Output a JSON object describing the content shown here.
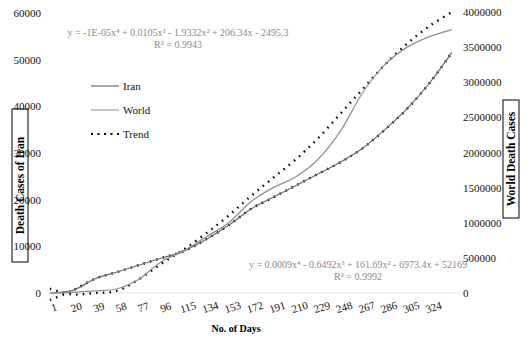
{
  "chart_data": {
    "type": "line",
    "title": "",
    "xlabel": "No. of Days",
    "ylabel": "Death Cases of Iran",
    "y2label": "World Death Cases",
    "x_ticks": [
      "1",
      "20",
      "39",
      "58",
      "77",
      "96",
      "115",
      "134",
      "153",
      "172",
      "191",
      "210",
      "229",
      "248",
      "267",
      "286",
      "305",
      "324"
    ],
    "y_ticks": [
      "0",
      "10000",
      "20000",
      "30000",
      "40000",
      "50000",
      "60000"
    ],
    "y2_ticks": [
      "0",
      "500000",
      "1000000",
      "1500000",
      "2000000",
      "2500000",
      "3000000",
      "3500000",
      "4000000"
    ],
    "ylim": [
      0,
      60000
    ],
    "y2lim": [
      0,
      4000000
    ],
    "xlim": [
      1,
      343
    ],
    "grid": false,
    "legend": {
      "position": "upper-left",
      "entries": [
        {
          "label": "Iran",
          "style": "solid",
          "color": "#666666"
        },
        {
          "label": "World",
          "style": "solid",
          "color": "#9a9a9a"
        },
        {
          "label": "Trend",
          "style": "dotted",
          "color": "#000000"
        }
      ]
    },
    "series": [
      {
        "name": "Iran",
        "axis": "left",
        "x": [
          1,
          20,
          39,
          58,
          77,
          96,
          115,
          134,
          153,
          172,
          191,
          210,
          229,
          248,
          267,
          286,
          305,
          324,
          343
        ],
        "values": [
          0,
          500,
          3000,
          4500,
          6000,
          7500,
          9000,
          11500,
          14500,
          18000,
          20500,
          23000,
          25500,
          28000,
          31000,
          35000,
          39500,
          45000,
          51500
        ]
      },
      {
        "name": "World",
        "axis": "right",
        "x": [
          1,
          20,
          39,
          58,
          77,
          96,
          115,
          134,
          153,
          172,
          191,
          210,
          229,
          248,
          267,
          286,
          305,
          324,
          343
        ],
        "values": [
          0,
          10000,
          30000,
          60000,
          200000,
          450000,
          600000,
          800000,
          1000000,
          1300000,
          1500000,
          1650000,
          1900000,
          2300000,
          2850000,
          3250000,
          3500000,
          3650000,
          3750000
        ]
      },
      {
        "name": "Trend (Iran poly fit)",
        "axis": "left",
        "equation": "y = 0.0009x⁴ - 0.6492x³ + 161.69x² - 6973.4x + 52169",
        "r2": "R² = 0.9992"
      },
      {
        "name": "Trend (World poly fit)",
        "axis": "right",
        "equation": "y = -1E-05x⁴ + 0.0105x³ - 1.9332x² + 206.34x - 2495.3",
        "r2": "R² = 0.9943"
      }
    ],
    "annotations": [
      "y = -1E-05x⁴ + 0.0105x³ - 1.9332x² + 206.34x - 2495.3",
      "R² = 0.9943",
      "y = 0.0009x⁴ - 0.6492x³ + 161.69x² - 6973.4x + 52169",
      "R² = 0.9992"
    ]
  },
  "labels": {
    "ylabel_left": "Death Cases of Iran",
    "ylabel_right": "World Death Cases",
    "xlabel": "No. of Days",
    "eq_top": "y = -1E-05x⁴ + 0.0105x³ - 1.9332x² + 206.34x - 2495.3",
    "r2_top": "R² = 0.9943",
    "eq_bottom": "y = 0.0009x⁴ - 0.6492x³ + 161.69x² - 6973.4x + 52169",
    "r2_bottom": "R² = 0.9992",
    "legend_iran": "Iran",
    "legend_world": "World",
    "legend_trend": "Trend"
  }
}
